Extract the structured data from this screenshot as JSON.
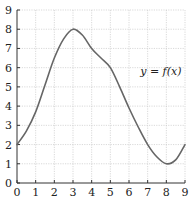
{
  "chart_data": {
    "type": "line",
    "title": "",
    "xlabel": "",
    "ylabel": "",
    "xlim": [
      0,
      9
    ],
    "ylim": [
      0,
      9
    ],
    "grid": true,
    "x_ticks": [
      "0",
      "1",
      "2",
      "3",
      "4",
      "5",
      "6",
      "7",
      "8",
      "9"
    ],
    "y_ticks": [
      "0",
      "1",
      "2",
      "3",
      "4",
      "5",
      "6",
      "7",
      "8",
      "9"
    ],
    "series": [
      {
        "name": "f(x)",
        "color": "#666666",
        "x": [
          0,
          0.5,
          1,
          1.5,
          2,
          2.5,
          3,
          3.5,
          4,
          4.5,
          5,
          5.5,
          6,
          6.5,
          7,
          7.5,
          8,
          8.5,
          9
        ],
        "y": [
          2,
          2.7,
          3.7,
          5.1,
          6.5,
          7.5,
          8,
          7.7,
          7,
          6.5,
          6,
          5,
          3.9,
          2.9,
          2,
          1.35,
          1,
          1.2,
          2
        ]
      }
    ],
    "annotations": [
      {
        "text": "y = f(x)",
        "x": 6.6,
        "y": 5.6
      }
    ]
  }
}
